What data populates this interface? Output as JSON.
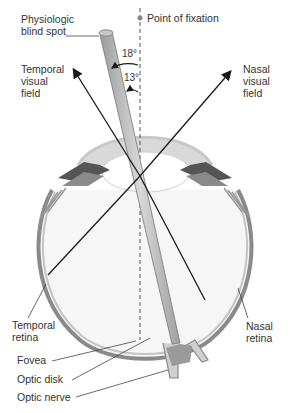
{
  "diagram": {
    "labels": {
      "blind_spot": "Physiologic\nblind spot",
      "fixation": "Point of fixation",
      "temporal_field": "Temporal\nvisual\nfield",
      "nasal_field": "Nasal\nvisual\nfield",
      "temporal_retina": "Temporal\nretina",
      "nasal_retina": "Nasal\nretina",
      "fovea": "Fovea",
      "optic_disk": "Optic disk",
      "optic_nerve": "Optic nerve"
    },
    "angles": {
      "outer": "18°",
      "inner": "13°"
    },
    "colors": {
      "line": "#1a1a1a",
      "dashed": "#555555",
      "eye_wall": "#9a9a9a",
      "cornea_fill": "#d6d6d6",
      "cone_fill": "#b8b8b8",
      "fixation_dot": "#888888"
    }
  }
}
